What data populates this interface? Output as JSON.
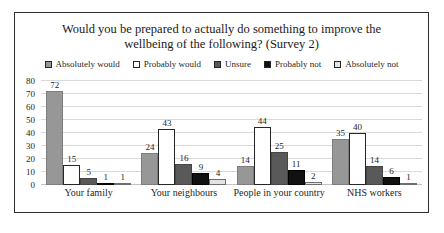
{
  "chart_data": {
    "type": "bar",
    "title": "Would you be prepared to actually do something to improve the wellbeing of the following? (Survey 2)",
    "categories": [
      "Your family",
      "Your neighbours",
      "People in your country",
      "NHS workers"
    ],
    "series": [
      {
        "name": "Absolutely would",
        "values": [
          72,
          24,
          14,
          35
        ],
        "fill": "#979797",
        "stroke": "#7d7d7d"
      },
      {
        "name": "Probably would",
        "values": [
          15,
          43,
          44,
          40
        ],
        "fill": "#ffffff",
        "stroke": "#262626"
      },
      {
        "name": "Unsure",
        "values": [
          5,
          16,
          25,
          14
        ],
        "fill": "#595959",
        "stroke": "#454545"
      },
      {
        "name": "Probably not",
        "values": [
          1,
          9,
          11,
          6
        ],
        "fill": "#111111",
        "stroke": "#000000"
      },
      {
        "name": "Absolutely not",
        "values": [
          1,
          4,
          2,
          1
        ],
        "fill": "#e3e3e3",
        "stroke": "#6e6e6e"
      }
    ],
    "xlabel": "",
    "ylabel": "",
    "ylim": [
      0,
      80
    ],
    "yticks": [
      0,
      10,
      20,
      30,
      40,
      50,
      60,
      70,
      80
    ],
    "grid": true,
    "legend_position": "top",
    "value_labels": true,
    "frame_border_color": "#2e2e2e",
    "gridline_color": "#d9d9d9"
  }
}
